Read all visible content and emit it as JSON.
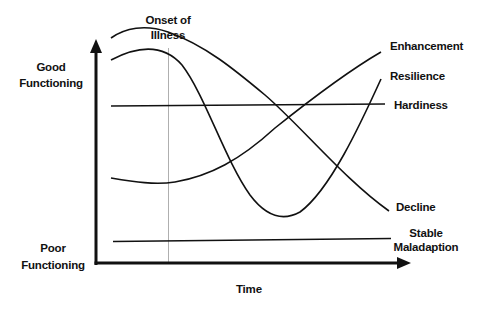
{
  "diagram": {
    "type": "conceptual-trajectory-diagram",
    "y_axis": {
      "top_label": [
        "Good",
        "Functioning"
      ],
      "bottom_label": [
        "Poor",
        "Functioning"
      ]
    },
    "x_axis": {
      "label": "Time"
    },
    "marker": {
      "label": [
        "Onset of",
        "Illness"
      ]
    },
    "trajectories": [
      {
        "name": "Enhancement",
        "shape": "low, dips slightly at onset, then rises above baseline"
      },
      {
        "name": "Resilience",
        "shape": "high, falls sharply after onset to a trough, then recovers upward"
      },
      {
        "name": "Hardiness",
        "shape": "flat, constant good functioning"
      },
      {
        "name": "Decline",
        "shape": "high, peaks before onset, then steadily declines"
      },
      {
        "name": "Stable Maladaption",
        "shape": "flat, constant poor functioning"
      }
    ],
    "colors": {
      "line": "#111111",
      "onset_line": "#999999",
      "background": "#ffffff"
    }
  },
  "labels": {
    "onset_line1": "Onset of",
    "onset_line2": "Illness",
    "good_line1": "Good",
    "good_line2": "Functioning",
    "poor_line1": "Poor",
    "poor_line2": "Functioning",
    "time": "Time",
    "enhancement": "Enhancement",
    "resilience": "Resilience",
    "hardiness": "Hardiness",
    "decline": "Decline",
    "stable_line1": "Stable",
    "stable_line2": "Maladaption"
  }
}
